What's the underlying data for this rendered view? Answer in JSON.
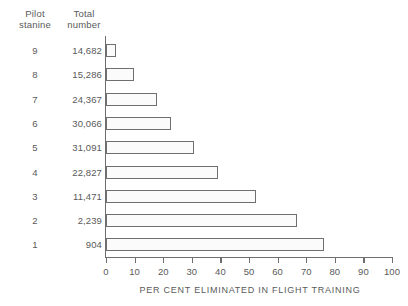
{
  "headers": {
    "stanine": "Pilot\nstanine",
    "total": "Total\nnumber"
  },
  "chart_data": {
    "type": "bar",
    "orientation": "horizontal",
    "title": "",
    "xlabel": "PER CENT ELIMINATED IN FLIGHT TRAINING",
    "ylabel": "Pilot stanine",
    "xlim": [
      0,
      100
    ],
    "xticks": [
      "0",
      "10",
      "20",
      "30",
      "40",
      "50",
      "60",
      "70",
      "80",
      "90",
      "100"
    ],
    "grid": false,
    "legend": null,
    "categories": [
      "9",
      "8",
      "7",
      "6",
      "5",
      "4",
      "3",
      "2",
      "1"
    ],
    "values": [
      3.5,
      9.7,
      17.8,
      22.7,
      30.7,
      39.3,
      52.4,
      66.8,
      76.3
    ],
    "extra_column": {
      "name": "Total number",
      "values": [
        "14,682",
        "15,286",
        "24,367",
        "30,066",
        "31,091",
        "22,827",
        "11,471",
        "2,239",
        "904"
      ]
    },
    "rows": [
      {
        "stanine": "9",
        "total": "14,682",
        "percent": 3.5
      },
      {
        "stanine": "8",
        "total": "15,286",
        "percent": 9.7
      },
      {
        "stanine": "7",
        "total": "24,367",
        "percent": 17.8
      },
      {
        "stanine": "6",
        "total": "30,066",
        "percent": 22.7
      },
      {
        "stanine": "5",
        "total": "31,091",
        "percent": 30.7
      },
      {
        "stanine": "4",
        "total": "22,827",
        "percent": 39.3
      },
      {
        "stanine": "3",
        "total": "11,471",
        "percent": 52.4
      },
      {
        "stanine": "2",
        "total": "2,239",
        "percent": 66.8
      },
      {
        "stanine": "1",
        "total": "904",
        "percent": 76.3
      }
    ],
    "colors": {
      "bar_fill": "#fbfbfb",
      "bar_border": "#6f6f6f",
      "axis": "#6f6f6f",
      "text": "#5a5a5a",
      "background": "#ffffff"
    }
  }
}
